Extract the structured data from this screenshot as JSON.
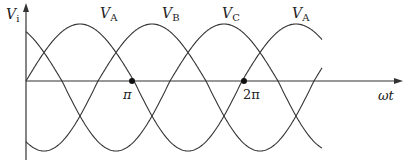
{
  "diagram": {
    "y_axis_label": {
      "main": "V",
      "sub": "i"
    },
    "x_axis_label": "ωt",
    "tick_labels": [
      "π",
      "2π"
    ],
    "marked_points": [
      "π",
      "2π"
    ],
    "waveforms": [
      {
        "name": "V_A",
        "label_main": "V",
        "label_sub": "A",
        "phase_deg": 0
      },
      {
        "name": "V_B",
        "label_main": "V",
        "label_sub": "B",
        "phase_deg": -120
      },
      {
        "name": "V_C",
        "label_main": "V",
        "label_sub": "C",
        "phase_deg": -240
      },
      {
        "name": "V_A",
        "label_main": "V",
        "label_sub": "A",
        "phase_deg": 0,
        "note": "second period label"
      }
    ]
  }
}
